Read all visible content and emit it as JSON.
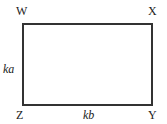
{
  "diagram": {
    "type": "rectangle",
    "vertices": {
      "top_left": "W",
      "top_right": "X",
      "bottom_right": "Y",
      "bottom_left": "Z"
    },
    "side_labels": {
      "left": "ka",
      "bottom": "kb"
    },
    "colors": {
      "stroke": "#333333",
      "background": "#ffffff"
    }
  }
}
